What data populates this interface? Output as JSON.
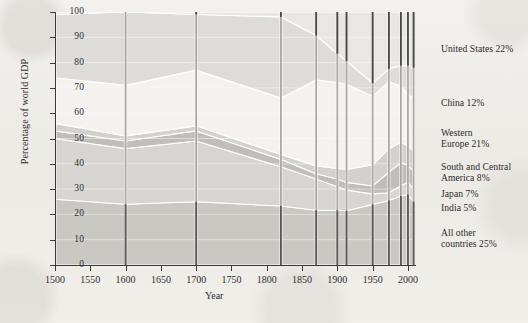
{
  "figure": {
    "axis_title_y": "Percentage of world GDP",
    "axis_title_x": "Year"
  },
  "legend": [
    {
      "id": "united-states",
      "label": "United States 22%",
      "top": 44
    },
    {
      "id": "china",
      "label": "China 12%",
      "top": 98
    },
    {
      "id": "western-europe",
      "label": "Western",
      "label2": "Europe 21%",
      "top": 128
    },
    {
      "id": "south-central-america",
      "label": "South and Central",
      "label2": "America 8%",
      "top": 162
    },
    {
      "id": "japan",
      "label": "Japan 7%",
      "top": 189
    },
    {
      "id": "india",
      "label": "India 5%",
      "top": 203
    },
    {
      "id": "all-other",
      "label": "All other",
      "label2": "countries 25%",
      "top": 228
    }
  ],
  "yticks": [
    "0",
    "10",
    "20",
    "30",
    "40",
    "50",
    "60",
    "70",
    "80",
    "90",
    "100"
  ],
  "xticks": [
    "1500",
    "1550",
    "1600",
    "1650",
    "1700",
    "1750",
    "1800",
    "1850",
    "1900",
    "1950",
    "2000"
  ],
  "chart_data": {
    "type": "area",
    "title": "",
    "subtitle": "",
    "xlabel": "Year",
    "ylabel": "Percentage of world GDP",
    "xlim": [
      1500,
      2010
    ],
    "ylim": [
      0,
      100
    ],
    "grid": true,
    "stacked": true,
    "legend_position": "right",
    "x": [
      1500,
      1600,
      1700,
      1820,
      1870,
      1900,
      1913,
      1950,
      1973,
      1990,
      2000,
      2008
    ],
    "series": [
      {
        "name": "All other countries",
        "legend": "All other countries 25%",
        "color": "#c9c8c3",
        "values": [
          26,
          24,
          25,
          24,
          21,
          21,
          21,
          23,
          25,
          27,
          29,
          25
        ]
      },
      {
        "name": "India",
        "legend": "India 5%",
        "color": "#d6d5d1",
        "values": [
          24,
          22,
          24,
          16,
          12,
          9,
          8,
          4,
          3,
          4,
          5,
          5
        ]
      },
      {
        "name": "Japan",
        "legend": "Japan 7%",
        "color": "#bfbeb9",
        "values": [
          3,
          3,
          4,
          3,
          2,
          3,
          3,
          3,
          8,
          9,
          7,
          7
        ]
      },
      {
        "name": "South and Central America",
        "legend": "South and Central America 8%",
        "color": "#d2d1cc",
        "values": [
          3,
          2,
          2,
          2,
          3,
          4,
          5,
          8,
          9,
          8,
          8,
          8
        ]
      },
      {
        "name": "Western Europe",
        "legend": "Western Europe 21%",
        "color": "#f3f2ef",
        "values": [
          18,
          20,
          22,
          23,
          33,
          33,
          33,
          26,
          26,
          22,
          21,
          21
        ]
      },
      {
        "name": "China",
        "legend": "China 12%",
        "color": "#dddcd8",
        "values": [
          25,
          29,
          22,
          33,
          17,
          11,
          9,
          5,
          5,
          8,
          12,
          12
        ]
      },
      {
        "name": "United States",
        "legend": "United States 22%",
        "color": "#e8e7e3",
        "values": [
          1,
          0,
          1,
          2,
          9,
          16,
          19,
          27,
          22,
          21,
          22,
          22
        ]
      }
    ],
    "data_bars": {
      "note": "vertical sample bars drawn at observation years",
      "years": [
        1500,
        1600,
        1700,
        1820,
        1870,
        1900,
        1913,
        1950,
        1973,
        1990,
        2000,
        2008
      ]
    }
  }
}
